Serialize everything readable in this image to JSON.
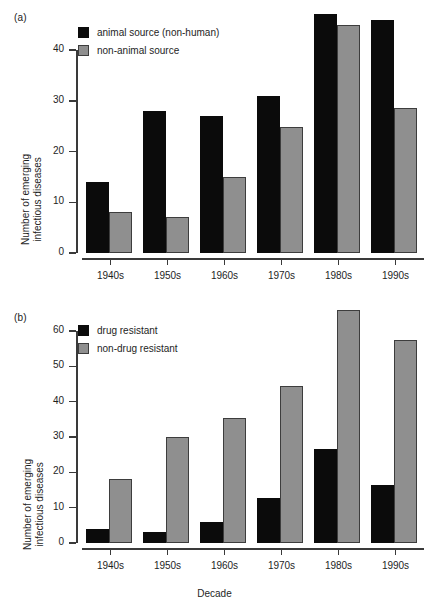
{
  "figure": {
    "panels": [
      {
        "id": "a",
        "label": "(a)",
        "chart_data": {
          "type": "bar",
          "title": "",
          "xlabel": "",
          "ylabel": "Number of emerging infectious diseases",
          "categories": [
            "1940s",
            "1950s",
            "1960s",
            "1970s",
            "1980s",
            "1990s"
          ],
          "series": [
            {
              "name": "animal source (non-human)",
              "color": "#0b0b0b",
              "values": [
                14,
                28,
                27,
                31,
                47,
                46
              ]
            },
            {
              "name": "non-animal source",
              "color": "#8f8f8f",
              "values": [
                8,
                7,
                15,
                24.8,
                45,
                28.5
              ]
            }
          ],
          "ylim": [
            0,
            40
          ],
          "yticks": [
            0,
            10,
            20,
            30,
            40
          ],
          "ytick_labels": [
            "0",
            "10",
            "20",
            "30",
            "40"
          ],
          "grid": false,
          "legend_position": "top-left"
        }
      },
      {
        "id": "b",
        "label": "(b)",
        "chart_data": {
          "type": "bar",
          "title": "",
          "xlabel": "Decade",
          "ylabel": "Number of emerging infectious diseases",
          "categories": [
            "1940s",
            "1950s",
            "1960s",
            "1970s",
            "1980s",
            "1990s"
          ],
          "series": [
            {
              "name": "drug resistant",
              "color": "#0b0b0b",
              "values": [
                4,
                3,
                6,
                12.8,
                26.5,
                16.5
              ]
            },
            {
              "name": "non-drug resistant",
              "color": "#8f8f8f",
              "values": [
                18,
                30,
                35.5,
                44.5,
                66,
                57.5
              ]
            }
          ],
          "ylim": [
            0,
            60
          ],
          "yticks": [
            0,
            10,
            20,
            30,
            40,
            50,
            60
          ],
          "ytick_labels": [
            "0",
            "10",
            "20",
            "30",
            "40",
            "50",
            "60"
          ],
          "grid": false,
          "legend_position": "top-left"
        }
      }
    ]
  },
  "chart_data": [
    {
      "type": "bar",
      "panel": "(a)",
      "title": "",
      "xlabel": "",
      "ylabel": "Number of emerging infectious diseases",
      "categories": [
        "1940s",
        "1950s",
        "1960s",
        "1970s",
        "1980s",
        "1990s"
      ],
      "series": [
        {
          "name": "animal source (non-human)",
          "values": [
            14,
            28,
            27,
            31,
            47,
            46
          ]
        },
        {
          "name": "non-animal source",
          "values": [
            8,
            7,
            15,
            24.8,
            45,
            28.5
          ]
        }
      ],
      "ylim": [
        0,
        40
      ],
      "yticks": [
        0,
        10,
        20,
        30,
        40
      ],
      "grid": false,
      "legend_position": "top-left"
    },
    {
      "type": "bar",
      "panel": "(b)",
      "title": "",
      "xlabel": "Decade",
      "ylabel": "Number of emerging infectious diseases",
      "categories": [
        "1940s",
        "1950s",
        "1960s",
        "1970s",
        "1980s",
        "1990s"
      ],
      "series": [
        {
          "name": "drug resistant",
          "values": [
            4,
            3,
            6,
            12.8,
            26.5,
            16.5
          ]
        },
        {
          "name": "non-drug resistant",
          "values": [
            18,
            30,
            35.5,
            44.5,
            66,
            57.5
          ]
        }
      ],
      "ylim": [
        0,
        60
      ],
      "yticks": [
        0,
        10,
        20,
        30,
        40,
        50,
        60
      ],
      "grid": false,
      "legend_position": "top-left"
    }
  ]
}
